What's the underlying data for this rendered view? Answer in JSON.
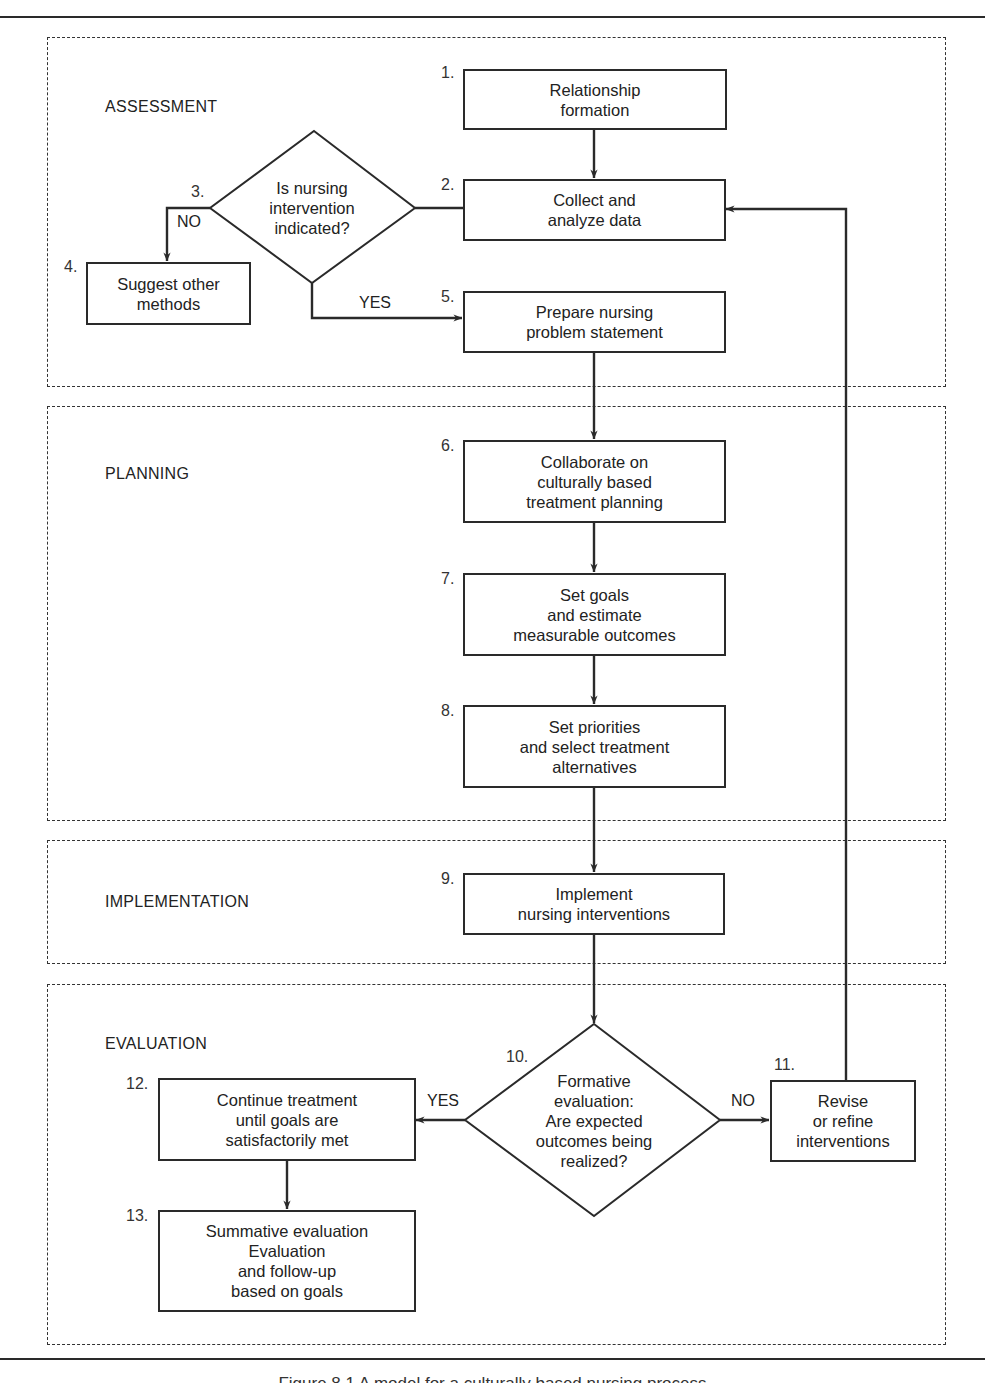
{
  "figure": {
    "caption": "Figure 8.1  A model for a culturally based nursing process"
  },
  "sections": [
    {
      "id": "assessment",
      "label": "ASSESSMENT"
    },
    {
      "id": "planning",
      "label": "PLANNING"
    },
    {
      "id": "implementation",
      "label": "IMPLEMENTATION"
    },
    {
      "id": "evaluation",
      "label": "EVALUATION"
    }
  ],
  "steps": {
    "s1": {
      "number": "1.",
      "text": "Relationship\nformation"
    },
    "s2": {
      "number": "2.",
      "text": "Collect and\nanalyze data"
    },
    "s3": {
      "number": "3.",
      "text": "Is nursing\nintervention\nindicated?"
    },
    "s4": {
      "number": "4.",
      "text": "Suggest other\nmethods"
    },
    "s5": {
      "number": "5.",
      "text": "Prepare nursing\nproblem statement"
    },
    "s6": {
      "number": "6.",
      "text": "Collaborate on\nculturally based\ntreatment planning"
    },
    "s7": {
      "number": "7.",
      "text": "Set goals\nand estimate\nmeasurable outcomes"
    },
    "s8": {
      "number": "8.",
      "text": "Set priorities\nand select treatment\nalternatives"
    },
    "s9": {
      "number": "9.",
      "text": "Implement\nnursing interventions"
    },
    "s10": {
      "number": "10.",
      "text": "Formative\nevaluation:\nAre expected\noutcomes being\nrealized?"
    },
    "s11": {
      "number": "11.",
      "text": "Revise\nor refine\ninterventions"
    },
    "s12": {
      "number": "12.",
      "text": "Continue treatment\nuntil goals are\nsatisfactorily met"
    },
    "s13": {
      "number": "13.",
      "text": "Summative evaluation\nEvaluation\nand follow-up\nbased on goals"
    }
  },
  "branches": {
    "s3_no": "NO",
    "s3_yes": "YES",
    "s10_yes": "YES",
    "s10_no": "NO"
  },
  "colors": {
    "line": "#2a2a2a",
    "background": "#ffffff"
  }
}
